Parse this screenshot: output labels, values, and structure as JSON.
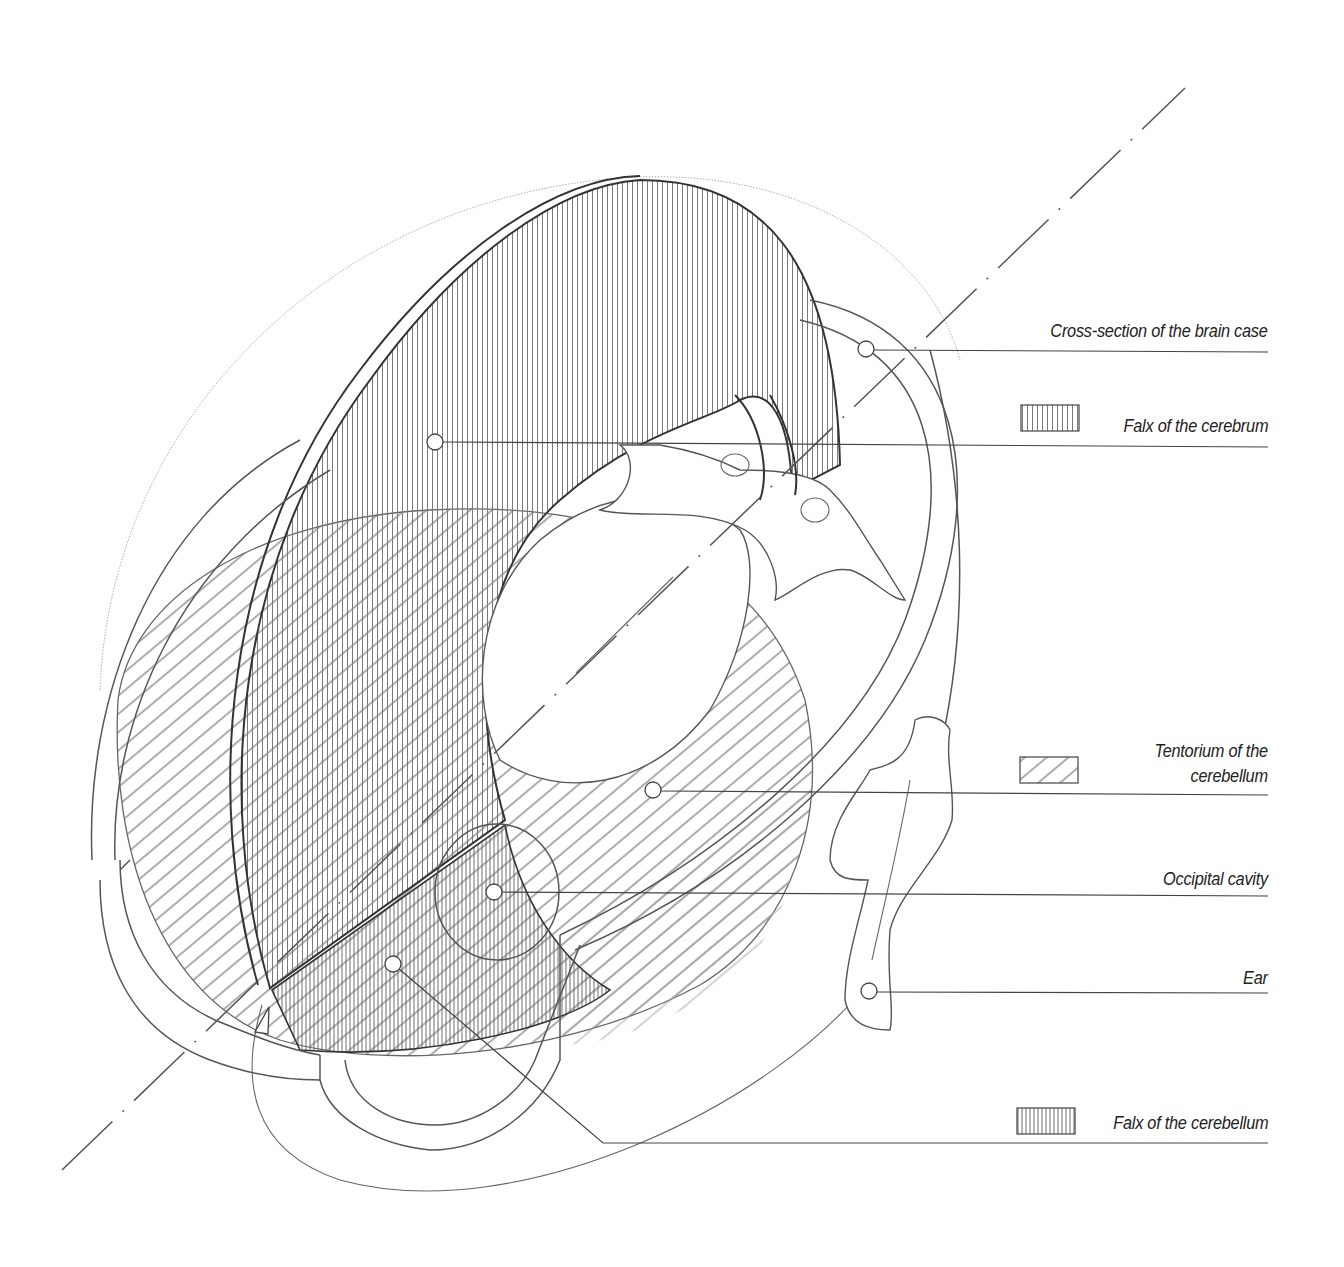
{
  "diagram": {
    "title": "",
    "colors": {
      "background": "#ffffff",
      "line": "#555555",
      "line_dark": "#333333",
      "hatch_vertical": "#777777",
      "hatch_diagonal": "#666666",
      "faint_outline": "#b0b0b0",
      "label_text": "#222222"
    },
    "labels": [
      {
        "id": "cross-section-brain-case",
        "text": "Cross-section of the brain case",
        "legend_swatch": "none",
        "marker": [
          866,
          348
        ],
        "line_y": 352
      },
      {
        "id": "falx-cerebrum",
        "text": "Falx of the cerebrum",
        "legend_swatch": "vertical-hatch",
        "marker": [
          435,
          442
        ],
        "line_y": 447
      },
      {
        "id": "tentorium-cerebellum",
        "text": "Tentorium of the\ncerebellum",
        "legend_swatch": "diagonal-hatch",
        "marker": [
          653,
          427
        ],
        "line_y": 795
      },
      {
        "id": "occipital-cavity",
        "text": "Occipital cavity",
        "legend_swatch": "none",
        "marker": [
          494,
          892
        ],
        "line_y": 896
      },
      {
        "id": "ear",
        "text": "Ear",
        "legend_swatch": "none",
        "marker": [
          869,
          991
        ],
        "line_y": 993
      },
      {
        "id": "falx-cerebellum",
        "text": "Falx of the cerebellum",
        "legend_swatch": "dense-vertical-hatch",
        "marker": [
          393,
          964
        ],
        "line_y": 1143
      }
    ],
    "legend": [
      {
        "pattern": "vertical-hatch",
        "meaning": "Falx of the cerebrum"
      },
      {
        "pattern": "diagonal-hatch",
        "meaning": "Tentorium of the cerebellum"
      },
      {
        "pattern": "dense-vertical-hatch",
        "meaning": "Falx of the cerebellum"
      }
    ],
    "axis": {
      "style": "dash-dot",
      "from": [
        62,
        1170
      ],
      "to": [
        1185,
        88
      ]
    }
  }
}
